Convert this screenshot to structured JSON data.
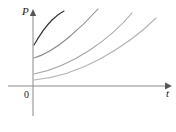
{
  "figure": {
    "title": "",
    "background_color": "#ffffff",
    "width": 176,
    "height": 132
  },
  "axes": {
    "vertical": {
      "label": "P",
      "name": "p-axis",
      "color": "#8a8a8a",
      "x": 33,
      "y_top": 12,
      "y_bottom": 116,
      "arrow": "up"
    },
    "horizontal": {
      "label": "t",
      "name": "t-axis",
      "color": "#8a8a8a",
      "y": 86,
      "x_left": 8,
      "x_right": 168,
      "arrow": "right"
    },
    "origin": {
      "label": "0",
      "x": 33,
      "y": 86
    }
  },
  "chart_data": {
    "type": "line",
    "title": "",
    "xlabel": "t",
    "ylabel": "P",
    "grid": false,
    "legend": null,
    "xlim": [
      0,
      1
    ],
    "ylim": [
      0,
      1
    ],
    "axis_ticks": {
      "x": [
        "0"
      ],
      "y": []
    },
    "annotations": [
      {
        "text": "P",
        "position": "vertical-axis-top"
      },
      {
        "text": "t",
        "position": "horizontal-axis-right"
      },
      {
        "text": "0",
        "position": "origin"
      }
    ],
    "series": [
      {
        "name": "curve-1",
        "color": "#2b2b2b",
        "stroke_width": 1.1,
        "y_intercept_px": 45,
        "path": "M 34 45 C 38 38, 44 28, 52 20 C 56 16, 60 13, 64 11"
      },
      {
        "name": "curve-2",
        "color": "#8d8d8d",
        "stroke_width": 1.1,
        "y_intercept_px": 58,
        "path": "M 34 58 C 44 55, 56 48, 68 38 C 80 28, 90 18, 98 9"
      },
      {
        "name": "curve-3",
        "color": "#a6a6a6",
        "stroke_width": 1.1,
        "y_intercept_px": 74,
        "path": "M 34 74 C 50 71, 70 63, 90 50 C 108 38, 122 25, 132 13"
      },
      {
        "name": "curve-4",
        "color": "#b4b4b4",
        "stroke_width": 1.1,
        "y_intercept_px": 80,
        "path": "M 34 80 C 54 78, 78 71, 100 59 C 122 47, 142 32, 156 18"
      }
    ]
  }
}
